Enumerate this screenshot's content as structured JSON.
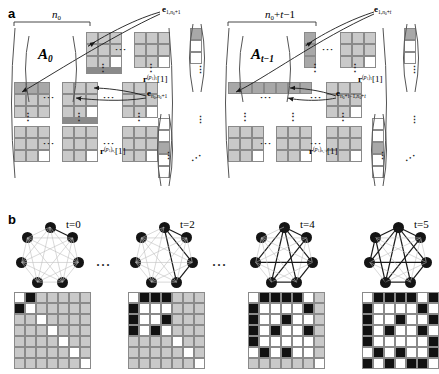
{
  "figure": {
    "panels": [
      {
        "letter": "a"
      },
      {
        "letter": "b"
      }
    ]
  },
  "panel_a": {
    "left": {
      "brace_label_html": "n0",
      "brace_label": "n₀",
      "matrix_label": "A0",
      "matrix_label_plain": "A₀",
      "edge_label_top": "e1,n0+1",
      "edge_label_bottom": "en0,n0+1",
      "vector_label_right": "r(p1)1[1]",
      "vector_label_bottom": "r(p1)n0[1]"
    },
    "right": {
      "brace_label": "n₀+t-1",
      "matrix_label_plain": "Aₜ₋₁",
      "edge_label_top": "e1,n0+t",
      "edge_label_bottom": "en0+t-1,n0+t",
      "vector_label_right": "r(p1)1[1]",
      "vector_label_bottom": "r(p1)n0+t[1]"
    },
    "ellipsis": "···",
    "vertical_ellipsis": "⋮"
  },
  "panel_b": {
    "separator": "···",
    "snapshots": [
      {
        "time_label": "t=0",
        "node_count": 7,
        "highlight_edges": [
          [
            0,
            1
          ]
        ],
        "matrix": [
          [
            "w",
            "k",
            "g",
            "g",
            "g",
            "g",
            "g"
          ],
          [
            "k",
            "w",
            "g",
            "g",
            "g",
            "g",
            "g"
          ],
          [
            "g",
            "g",
            "w",
            "g",
            "g",
            "g",
            "g"
          ],
          [
            "g",
            "g",
            "g",
            "w",
            "g",
            "g",
            "g"
          ],
          [
            "g",
            "g",
            "g",
            "g",
            "w",
            "g",
            "g"
          ],
          [
            "g",
            "g",
            "g",
            "g",
            "g",
            "w",
            "g"
          ],
          [
            "g",
            "g",
            "g",
            "g",
            "g",
            "g",
            "w"
          ]
        ]
      },
      {
        "time_label": "t=2",
        "node_count": 7,
        "highlight_edges": [
          [
            0,
            1
          ],
          [
            0,
            2
          ],
          [
            0,
            3
          ],
          [
            2,
            3
          ]
        ],
        "matrix": [
          [
            "w",
            "k",
            "k",
            "k",
            "g",
            "g",
            "g"
          ],
          [
            "k",
            "w",
            "w",
            "w",
            "g",
            "g",
            "g"
          ],
          [
            "k",
            "w",
            "w",
            "k",
            "g",
            "g",
            "g"
          ],
          [
            "k",
            "w",
            "k",
            "w",
            "g",
            "g",
            "g"
          ],
          [
            "g",
            "g",
            "g",
            "g",
            "w",
            "g",
            "g"
          ],
          [
            "g",
            "g",
            "g",
            "g",
            "g",
            "w",
            "g"
          ],
          [
            "g",
            "g",
            "g",
            "g",
            "g",
            "g",
            "w"
          ]
        ]
      },
      {
        "time_label": "t=4",
        "node_count": 7,
        "highlight_edges": [
          [
            0,
            1
          ],
          [
            0,
            2
          ],
          [
            0,
            3
          ],
          [
            0,
            4
          ],
          [
            0,
            5
          ],
          [
            2,
            3
          ],
          [
            2,
            5
          ],
          [
            3,
            4
          ],
          [
            1,
            4
          ]
        ],
        "matrix": [
          [
            "w",
            "k",
            "k",
            "k",
            "k",
            "w",
            "g"
          ],
          [
            "k",
            "w",
            "w",
            "w",
            "w",
            "k",
            "g"
          ],
          [
            "k",
            "w",
            "w",
            "k",
            "w",
            "w",
            "g"
          ],
          [
            "k",
            "w",
            "k",
            "w",
            "w",
            "k",
            "g"
          ],
          [
            "k",
            "w",
            "w",
            "w",
            "w",
            "w",
            "g"
          ],
          [
            "w",
            "k",
            "w",
            "k",
            "w",
            "w",
            "g"
          ],
          [
            "g",
            "g",
            "g",
            "g",
            "g",
            "g",
            "w"
          ]
        ]
      },
      {
        "time_label": "t=5",
        "node_count": 7,
        "highlight_edges": [
          [
            0,
            1
          ],
          [
            0,
            2
          ],
          [
            0,
            3
          ],
          [
            0,
            4
          ],
          [
            0,
            5
          ],
          [
            0,
            6
          ],
          [
            2,
            3
          ],
          [
            2,
            5
          ],
          [
            3,
            4
          ],
          [
            1,
            4
          ],
          [
            4,
            6
          ],
          [
            5,
            6
          ]
        ],
        "matrix": [
          [
            "w",
            "k",
            "k",
            "k",
            "k",
            "w",
            "k"
          ],
          [
            "k",
            "w",
            "w",
            "w",
            "w",
            "k",
            "w"
          ],
          [
            "k",
            "w",
            "w",
            "k",
            "w",
            "w",
            "k"
          ],
          [
            "k",
            "w",
            "k",
            "w",
            "w",
            "k",
            "w"
          ],
          [
            "k",
            "w",
            "w",
            "w",
            "w",
            "w",
            "k"
          ],
          [
            "w",
            "k",
            "w",
            "k",
            "w",
            "w",
            "k"
          ],
          [
            "k",
            "w",
            "k",
            "w",
            "k",
            "k",
            "w"
          ]
        ]
      }
    ]
  },
  "colors": {
    "gray": "#c9c9c9",
    "white": "#ffffff",
    "black": "#111111",
    "node": "#141414",
    "edge_faint": "#bfbfbf",
    "edge_strong": "#1a1a1a"
  }
}
